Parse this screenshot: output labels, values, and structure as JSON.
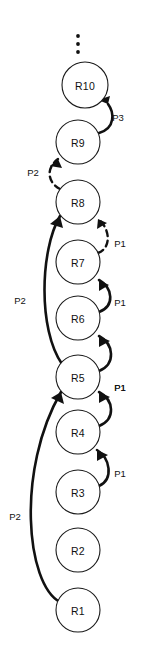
{
  "diagram": {
    "background_color": "#ffffff",
    "stroke_color": "#111111",
    "node_fill": "#ffffff",
    "canvas": {
      "width": 143,
      "height": 653
    },
    "continuation_marker": {
      "name": "vertical-ellipsis",
      "symbol": "⋮",
      "x": 78,
      "dot_ys": [
        36,
        44,
        52
      ],
      "dot_radius": 1.9
    },
    "nodes": [
      {
        "id": "R10",
        "label": "R10",
        "cx": 85,
        "cy": 85,
        "r": 23
      },
      {
        "id": "R9",
        "label": "R9",
        "cx": 78,
        "cy": 142,
        "r": 22
      },
      {
        "id": "R8",
        "label": "R8",
        "cx": 78,
        "cy": 202,
        "r": 22
      },
      {
        "id": "R7",
        "label": "R7",
        "cx": 78,
        "cy": 262,
        "r": 22
      },
      {
        "id": "R6",
        "label": "R6",
        "cx": 78,
        "cy": 318,
        "r": 22
      },
      {
        "id": "R5",
        "label": "R5",
        "cx": 78,
        "cy": 377,
        "r": 22
      },
      {
        "id": "R4",
        "label": "R4",
        "cx": 78,
        "cy": 432,
        "r": 22
      },
      {
        "id": "R3",
        "label": "R3",
        "cx": 78,
        "cy": 492,
        "r": 22
      },
      {
        "id": "R2",
        "label": "R2",
        "cx": 78,
        "cy": 550,
        "r": 22
      },
      {
        "id": "R1",
        "label": "R1",
        "cx": 78,
        "cy": 610,
        "r": 22
      }
    ],
    "edges": [
      {
        "id": "e-r9-r10",
        "from": "R9",
        "to": "R10",
        "label": "P3",
        "style": "solid",
        "side": "right",
        "label_x": 118,
        "label_y": 117,
        "path": "M 99 133 C 116 128 114 112 108 104",
        "arrow_points": "108,104 98,100 110,96"
      },
      {
        "id": "e-r8-r9",
        "from": "R8",
        "to": "R9",
        "label": "P2",
        "style": "dashed",
        "side": "left",
        "label_x": 33,
        "label_y": 172,
        "path": "M 60 189 C 47 182 46 168 58 159",
        "arrow_points": "58,159 50,166 62,168"
      },
      {
        "id": "e-r7-r8",
        "from": "R7",
        "to": "R8",
        "label": "P1",
        "style": "dashed",
        "side": "right",
        "label_x": 120,
        "label_y": 243,
        "path": "M 98 253 C 112 248 110 228 98 219",
        "arrow_points": "98,219 97,229 107,223"
      },
      {
        "id": "e-r6-r7",
        "from": "R6",
        "to": "R7",
        "label": "P1",
        "style": "solid",
        "side": "right",
        "label_x": 120,
        "label_y": 302,
        "path": "M 99 312 C 115 306 113 288 99 280",
        "arrow_points": "99,280 99,291 109,285"
      },
      {
        "id": "e-r5-r6",
        "from": "R5",
        "to": "R6",
        "label": "P1",
        "style": "solid",
        "side": "right",
        "label_x": 120,
        "label_y": 387,
        "path": "M 99 371 C 116 364 114 344 99 336",
        "arrow_points": "99,336 99,347 110,341"
      },
      {
        "id": "e-r4-r5",
        "from": "R4",
        "to": "R5",
        "label": "P1",
        "style": "solid",
        "side": "right",
        "label_x": 120,
        "label_y": 387,
        "path": "M 99 426 C 116 419 114 400 99 392",
        "arrow_points": "99,392 99,403 110,397"
      },
      {
        "id": "e-r3-r4",
        "from": "R3",
        "to": "R4",
        "label": "P1",
        "style": "solid",
        "side": "right",
        "label_x": 120,
        "label_y": 473,
        "path": "M 99 486 C 114 479 110 458 97 450",
        "arrow_points": "97,450 97,461 108,455"
      },
      {
        "id": "e-r5-r8",
        "from": "R5",
        "to": "R8",
        "label": "P2",
        "style": "solid",
        "side": "left",
        "label_x": 20,
        "label_y": 300,
        "path": "M 62 364 C 38 330 40 250 60 216",
        "arrow_points": "60,216 50,224 63,228"
      },
      {
        "id": "e-r1-r5",
        "from": "R1",
        "to": "R5",
        "label": "P2",
        "style": "solid",
        "side": "left",
        "label_x": 15,
        "label_y": 516,
        "path": "M 60 602 C 26 584 16 470 61 392",
        "arrow_points": "61,392 51,398 64,404"
      }
    ],
    "legend": {
      "phases": [
        "P1",
        "P2",
        "P3"
      ]
    }
  }
}
